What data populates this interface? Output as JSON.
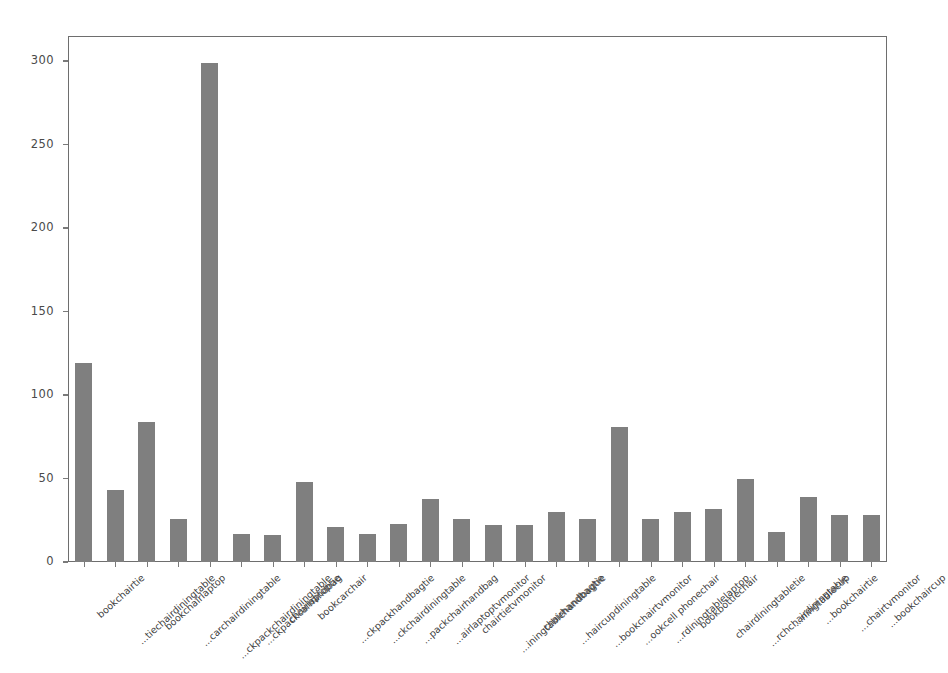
{
  "chart_data": {
    "type": "bar",
    "title": "",
    "xlabel": "",
    "ylabel": "",
    "ylim": [
      0,
      315
    ],
    "xlim": [
      -0.6,
      25.6
    ],
    "grid": false,
    "legend": null,
    "bar_color": "#7f7f7f",
    "frame_color": "#6e6e6e",
    "tick_label_color": "#4a4a4a",
    "ytick_values": [
      0,
      50,
      100,
      150,
      200,
      250,
      300
    ],
    "ytick_labels": [
      "0",
      "50",
      "100",
      "150",
      "200",
      "250",
      "300"
    ],
    "categories": [
      "bookchairtie",
      "...tiechairdiningtable",
      "bookchairlaptop",
      "...carchairdiningtable",
      "...ckpackchairdiningtable",
      "...ckpackcarhandbag",
      "chairlaptoptie",
      "bookcarchair",
      "...ckpackhandbagtie",
      "...ckchairdiningtable",
      "...packchairhandbag",
      "...airlaptoptvmonitor",
      "chairtietvmonitor",
      "...iningtablehandbagtie",
      "chairhandbagtie",
      "...haircupdiningtable",
      "...bookchairtvmonitor",
      "...ookcell phonechair",
      "...rdiningtablelaptop",
      "bookbottlechair",
      "chairdiningtabletie",
      "...rchchairdiningtable",
      "...ningtablecup",
      "...bookchairtie",
      "...chairtvmonitor",
      "...bookchaircup"
    ],
    "values": [
      119,
      43,
      84,
      26,
      299,
      17,
      16,
      48,
      21,
      17,
      23,
      38,
      26,
      22,
      22,
      30,
      26,
      81,
      26,
      30,
      32,
      50,
      18,
      39,
      28,
      28
    ],
    "n_bars": 26,
    "bar_width_fraction": 0.55
  },
  "caption": {
    "text": ""
  }
}
